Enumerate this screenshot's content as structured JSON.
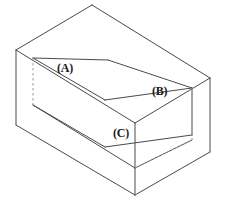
{
  "figure": {
    "kind": "isometric-technical-drawing",
    "background_color": "#ffffff",
    "line_color": "#4a4a4a",
    "hidden_line_color": "#9a9a9a",
    "label_color": "#1a1a1a",
    "labels": [
      {
        "id": "A",
        "text": "(A)",
        "x": 57,
        "y": 62,
        "refers_to": "top-face-left-rail"
      },
      {
        "id": "B",
        "text": "(B)",
        "x": 152,
        "y": 85,
        "refers_to": "slot-right-inner-wall"
      },
      {
        "id": "C",
        "text": "(C)",
        "x": 113,
        "y": 127,
        "refers_to": "slot-floor-front-edge"
      }
    ],
    "geometry": {
      "outer_solid": {
        "top_back_left": [
          16,
          50
        ],
        "top_apex": [
          92,
          5
        ],
        "top_right": [
          210,
          78
        ],
        "top_front": [
          135,
          123
        ],
        "bottom_left": [
          16,
          125
        ],
        "bottom_front": [
          135,
          195
        ],
        "bottom_right": [
          210,
          152
        ]
      },
      "slot": {
        "near_left_top": [
          33,
          58
        ],
        "near_inner_corner": [
          105,
          100
        ],
        "far_top": [
          108,
          60
        ],
        "right_top": [
          192,
          88
        ],
        "floor_front": [
          135,
          168
        ],
        "floor_right": [
          192,
          140
        ]
      },
      "hidden_edges": [
        {
          "from": [
            33,
            58
          ],
          "to": [
            33,
            105
          ],
          "style": "dashed",
          "name": "left-inner-vertical"
        },
        {
          "from": [
            192,
            88
          ],
          "to": [
            192,
            140
          ],
          "style": "dashed",
          "name": "right-inner-vertical"
        },
        {
          "from": [
            135,
            168
          ],
          "to": [
            192,
            140
          ],
          "style": "dashed",
          "name": "floor-back-right-edge"
        }
      ]
    }
  }
}
